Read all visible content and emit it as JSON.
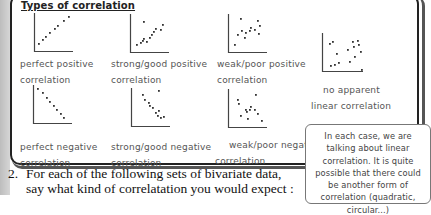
{
  "title": "Types of correlation",
  "cards": [
    {
      "id": "perfect-positive",
      "label_line1": "perfect positive",
      "label_line2": "correlation",
      "points": [
        [
          3,
          30
        ],
        [
          7,
          26
        ],
        [
          10,
          23
        ],
        [
          14,
          19
        ],
        [
          19,
          15
        ],
        [
          22,
          12
        ],
        [
          28,
          7
        ],
        [
          33,
          3
        ]
      ]
    },
    {
      "id": "strong-positive",
      "label_line1": "strong/good positive",
      "label_line2": "correlation",
      "points": [
        [
          5,
          30
        ],
        [
          9,
          28
        ],
        [
          11,
          26
        ],
        [
          12,
          24
        ],
        [
          15,
          27
        ],
        [
          18,
          23
        ],
        [
          20,
          20
        ],
        [
          22,
          17
        ],
        [
          24,
          14
        ],
        [
          29,
          15
        ],
        [
          31,
          10
        ],
        [
          12,
          7
        ]
      ]
    },
    {
      "id": "weak-positive",
      "label_line1": "weak/poor positive",
      "label_line2": "correlation",
      "points": [
        [
          5,
          30
        ],
        [
          8,
          20
        ],
        [
          12,
          16
        ],
        [
          15,
          23
        ],
        [
          16,
          18
        ],
        [
          20,
          16
        ],
        [
          21,
          13
        ],
        [
          25,
          15
        ],
        [
          28,
          6
        ],
        [
          29,
          19
        ],
        [
          30,
          11
        ],
        [
          11,
          4
        ]
      ]
    },
    {
      "id": "no-apparent",
      "label_line1": "no apparent",
      "label_line2": "linear correlation",
      "points": [
        [
          6,
          10
        ],
        [
          9,
          8
        ],
        [
          13,
          20
        ],
        [
          7,
          32
        ],
        [
          11,
          31
        ],
        [
          15,
          29
        ],
        [
          24,
          16
        ],
        [
          26,
          28
        ],
        [
          29,
          8
        ],
        [
          30,
          13
        ],
        [
          31,
          23
        ],
        [
          34,
          7
        ],
        [
          35,
          11
        ],
        [
          37,
          18
        ],
        [
          38,
          36
        ]
      ]
    },
    {
      "id": "perfect-negative",
      "label_line1": "perfect negative",
      "label_line2": "correlation",
      "points": [
        [
          3,
          3
        ],
        [
          8,
          7
        ],
        [
          12,
          12
        ],
        [
          15,
          16
        ],
        [
          19,
          20
        ],
        [
          22,
          24
        ],
        [
          26,
          28
        ],
        [
          29,
          32
        ]
      ]
    },
    {
      "id": "strong-negative",
      "label_line1": "strong/good negative",
      "label_line2": "correlation",
      "points": [
        [
          10,
          6
        ],
        [
          26,
          2
        ],
        [
          12,
          11
        ],
        [
          16,
          14
        ],
        [
          17,
          17
        ],
        [
          20,
          19
        ],
        [
          23,
          24
        ],
        [
          26,
          22
        ],
        [
          25,
          27
        ],
        [
          28,
          29
        ],
        [
          31,
          28
        ]
      ]
    },
    {
      "id": "weak-negative",
      "label_line1": "weak/poor negative",
      "label_line2": "correlation",
      "points": [
        [
          9,
          14
        ],
        [
          26,
          5
        ],
        [
          11,
          26
        ],
        [
          16,
          20
        ],
        [
          17,
          22
        ],
        [
          20,
          20
        ],
        [
          21,
          17
        ],
        [
          25,
          20
        ],
        [
          28,
          24
        ],
        [
          18,
          29
        ],
        [
          32,
          31
        ],
        [
          8,
          10
        ]
      ]
    }
  ],
  "callout": {
    "text": "In each case, we are talking about linear correlation. It is quite possible that there could be another form of correlation (quadratic, circular...)"
  },
  "question": {
    "number": "2.",
    "line1": "For each of the following sets of bivariate data,",
    "line2": "say what kind of correlatation you would expect :"
  }
}
